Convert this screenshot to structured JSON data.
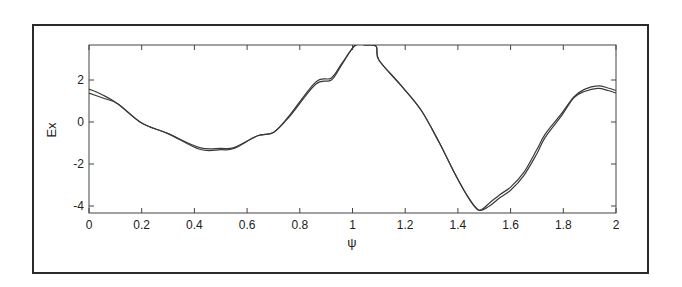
{
  "chart_data": {
    "type": "line",
    "title": "",
    "xlabel": "ψ",
    "ylabel": "Ex",
    "xlim": [
      0,
      2
    ],
    "ylim": [
      -4.2,
      3.7
    ],
    "x_ticks": [
      0,
      0.2,
      0.4,
      0.6,
      0.8,
      1,
      1.2,
      1.4,
      1.6,
      1.8,
      2
    ],
    "x_tick_labels": [
      "0",
      "0.2",
      "0.4",
      "0.6",
      "0.8",
      "1",
      "1.2",
      "1.4",
      "1.6",
      "1.8",
      "2"
    ],
    "y_ticks": [
      2,
      0,
      -2,
      -4
    ],
    "y_tick_labels": [
      "2",
      "0",
      "-2",
      "-4"
    ],
    "grid": false,
    "legend": null,
    "series": [
      {
        "name": "curve-1",
        "x": [
          0,
          0.05,
          0.11,
          0.2,
          0.3,
          0.42,
          0.5,
          0.55,
          0.64,
          0.7,
          0.76,
          0.86,
          0.92,
          0.96,
          1.01,
          1.05,
          1.09,
          1.1,
          1.18,
          1.26,
          1.33,
          1.39,
          1.44,
          1.48,
          1.52,
          1.56,
          1.6,
          1.65,
          1.7,
          1.73,
          1.79,
          1.84,
          1.88,
          1.93,
          1.97,
          2.0
        ],
        "y": [
          1.57,
          1.3,
          0.86,
          -0.05,
          -0.55,
          -1.22,
          -1.25,
          -1.22,
          -0.65,
          -0.5,
          0.3,
          1.9,
          2.1,
          2.8,
          3.65,
          3.68,
          3.6,
          2.95,
          1.8,
          0.57,
          -1.0,
          -2.5,
          -3.6,
          -4.2,
          -3.85,
          -3.45,
          -3.1,
          -2.4,
          -1.3,
          -0.6,
          0.35,
          1.2,
          1.55,
          1.72,
          1.62,
          1.5
        ]
      },
      {
        "name": "curve-2",
        "x": [
          0,
          0.05,
          0.11,
          0.2,
          0.3,
          0.42,
          0.5,
          0.55,
          0.64,
          0.7,
          0.76,
          0.86,
          0.92,
          0.96,
          1.01,
          1.05,
          1.09,
          1.1,
          1.18,
          1.26,
          1.33,
          1.39,
          1.44,
          1.48,
          1.52,
          1.56,
          1.6,
          1.65,
          1.7,
          1.73,
          1.79,
          1.84,
          1.88,
          1.93,
          1.97,
          2.0
        ],
        "y": [
          1.38,
          1.15,
          0.86,
          -0.05,
          -0.55,
          -1.3,
          -1.32,
          -1.26,
          -0.65,
          -0.5,
          0.25,
          1.8,
          2.0,
          2.75,
          3.65,
          3.68,
          3.6,
          2.95,
          1.8,
          0.57,
          -1.0,
          -2.5,
          -3.6,
          -4.2,
          -4.0,
          -3.6,
          -3.25,
          -2.55,
          -1.5,
          -0.75,
          0.25,
          1.15,
          1.45,
          1.6,
          1.5,
          1.38
        ]
      }
    ]
  },
  "axes": {
    "x_label": "ψ",
    "y_label": "Ex"
  }
}
